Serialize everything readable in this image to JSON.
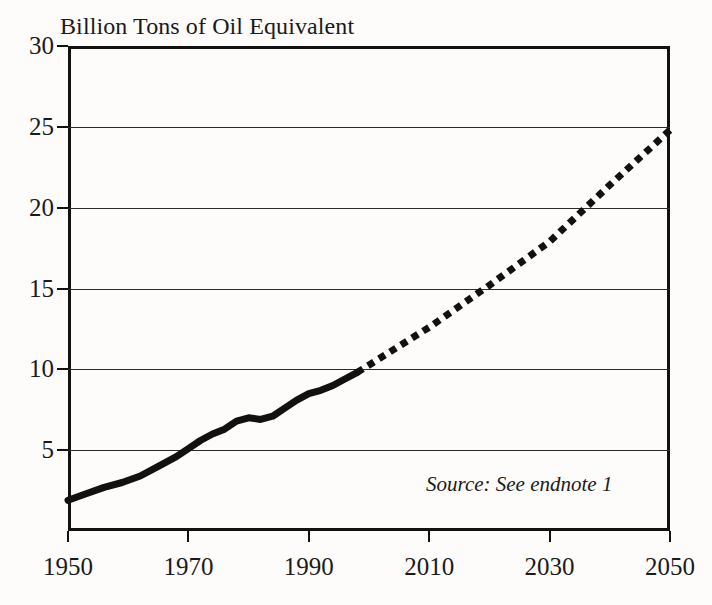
{
  "figure": {
    "title": "Billion Tons of Oil Equivalent",
    "source_note": "Source: See endnote 1",
    "background_color": "#fdfcfa",
    "ink_color": "#111111"
  },
  "axes": {
    "y_ticks": [
      "30",
      "25",
      "20",
      "15",
      "10",
      "5"
    ],
    "x_ticks": [
      "1950",
      "1970",
      "1990",
      "2010",
      "2030",
      "2050"
    ]
  },
  "chart_data": {
    "type": "line",
    "title": "Billion Tons of Oil Equivalent",
    "subtitle": "",
    "xlabel": "",
    "ylabel": "Billion Tons of Oil Equivalent",
    "xlim": [
      1950,
      2050
    ],
    "ylim": [
      0,
      30
    ],
    "ytick_values": [
      5,
      10,
      15,
      20,
      25,
      30
    ],
    "xtick_values": [
      1950,
      1970,
      1990,
      2010,
      2030,
      2050
    ],
    "grid": "horizontal",
    "legend": "none",
    "annotations": [
      {
        "text": "Source: See endnote 1",
        "x": 2022,
        "ystyle": "italic",
        "y": 3.4
      }
    ],
    "series": [
      {
        "name": "World Energy Use (historical)",
        "style": "solid",
        "linewidth": 6,
        "color": "#111111",
        "x": [
          1950,
          1953,
          1956,
          1959,
          1962,
          1965,
          1968,
          1970,
          1972,
          1974,
          1976,
          1978,
          1980,
          1982,
          1984,
          1986,
          1988,
          1990,
          1992,
          1994,
          1996,
          1998
        ],
        "y": [
          1.9,
          2.3,
          2.7,
          3.0,
          3.4,
          4.0,
          4.6,
          5.1,
          5.6,
          6.0,
          6.3,
          6.8,
          7.0,
          6.9,
          7.1,
          7.6,
          8.1,
          8.5,
          8.7,
          9.0,
          9.4,
          9.8
        ]
      },
      {
        "name": "World Energy Use (projected)",
        "style": "dotted",
        "linewidth": 6,
        "color": "#111111",
        "x": [
          1998,
          2010,
          2020,
          2030,
          2040,
          2050
        ],
        "y": [
          9.8,
          12.6,
          15.2,
          17.9,
          21.4,
          24.8
        ]
      }
    ]
  }
}
